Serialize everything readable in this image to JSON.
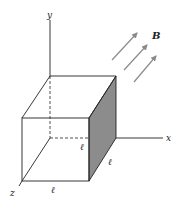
{
  "diagram": {
    "type": "cube-in-magnetic-field",
    "axes": {
      "x_label": "x",
      "y_label": "y",
      "z_label": "z"
    },
    "field": {
      "label": "B",
      "arrow_count": 3,
      "arrow_color": "#8a8a8a"
    },
    "cube": {
      "edge_labels": [
        "ℓ",
        "ℓ",
        "ℓ"
      ],
      "shaded_face_color": "#8c8c8c",
      "edge_color": "#222222"
    }
  }
}
